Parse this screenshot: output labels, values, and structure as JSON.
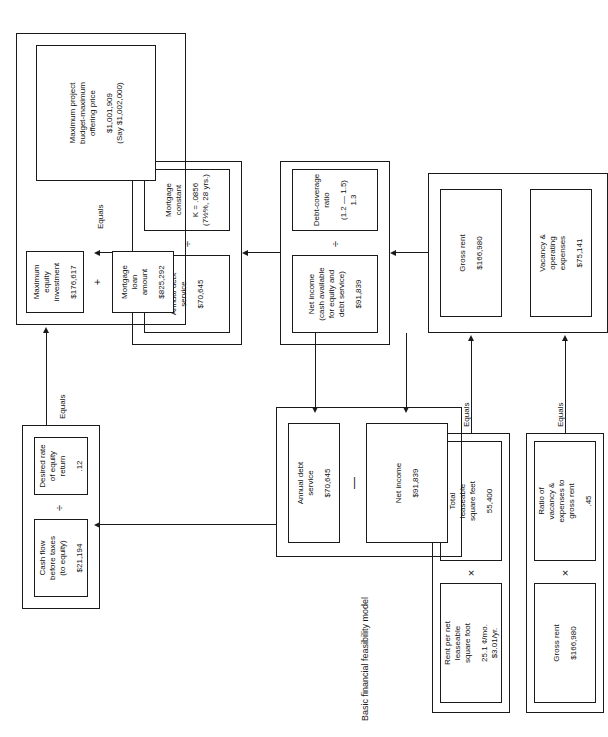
{
  "figure": {
    "title": "Basic financial feasibility model",
    "orientation": "landscape-rotated-90ccw",
    "line_color": "#1a1a1a",
    "background": "#ffffff"
  },
  "operators": {
    "multiply": "×",
    "divide": "÷",
    "plus": "+",
    "minus": "—",
    "equals_label": "Equals"
  },
  "groups": {
    "rent_inputs": {
      "name": "rent-inputs-group",
      "boxes": {
        "rent_per_sf": {
          "label": "Rent per net\nleaseable\nsquare foot",
          "value": "25.1 ¢/mo.\n$3.01/yr."
        },
        "total_sf": {
          "label": "Total\nleaseable\nsquare feet",
          "value": "55,400"
        },
        "gross_rent": {
          "label": "Gross rent",
          "value": "$166,980"
        },
        "vacancy_ratio": {
          "label": "Ratio of\nvacancy &\nexpenses to\ngross rent",
          "value": ".45"
        }
      },
      "equals_top": "Equals",
      "equals_bottom": "Equals"
    },
    "gross_rent_group": {
      "name": "gross-rent-and-expenses-group",
      "boxes": {
        "gross_rent": {
          "label": "Gross rent",
          "value": "$166,980"
        },
        "vacancy_expenses": {
          "label": "Vacancy &\noperating\nexpenses",
          "value": "$75,141"
        }
      }
    },
    "net_income_group": {
      "name": "net-income-and-dcr-group",
      "boxes": {
        "net_income": {
          "label": "Net income\n(cash available\nfor equity and\ndebt service)",
          "value": "$91,839"
        },
        "dcr": {
          "label": "Debt-coverage\nratio",
          "value": "(1.2 — 1.5)\n1.3"
        }
      }
    },
    "ads_group": {
      "name": "annual-debt-service-and-mortgage-constant-group",
      "boxes": {
        "annual_debt_service": {
          "label": "Annual debt\nservice",
          "value": "$70,645"
        },
        "mortgage_constant": {
          "label": "Mortgage\nconstant",
          "value": "K = .0856\n(7½%, 28 yrs.)"
        }
      }
    },
    "income_group": {
      "name": "net-income-minus-debt-service-group",
      "boxes": {
        "net_income": {
          "label": "Net income",
          "value": "$91,839"
        },
        "annual_debt_service": {
          "label": "Annual debt\nservice",
          "value": "$70,645"
        }
      }
    },
    "equity_group": {
      "name": "cash-flow-and-equity-return-group",
      "boxes": {
        "cash_flow": {
          "label": "Cash flow\nbefore taxes\n(to equity)",
          "value": "$21,194"
        },
        "desired_return": {
          "label": "Desired rate\nof equity\nreturn",
          "value": ".12"
        }
      },
      "equals_label": "Equals"
    },
    "budget_group": {
      "name": "maximum-project-budget-group",
      "boxes": {
        "max_equity": {
          "label": "Maximum\nequity\ninvestment",
          "value": "$176,617"
        },
        "mortgage_loan": {
          "label": "Mortgage\nloan\namount",
          "value": "$825,292"
        },
        "max_budget": {
          "label": "Maximum project\nbudget-maximum\noffering price",
          "value": "$1,001,909\n(Say $1,002,000)"
        }
      },
      "equals_label": "Equals"
    }
  }
}
